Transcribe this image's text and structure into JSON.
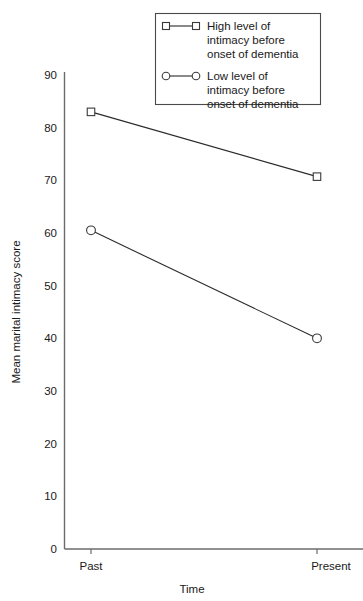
{
  "chart_data": {
    "type": "line",
    "title": "",
    "xlabel": "Time",
    "ylabel": "Mean marital intimacy score",
    "categories": [
      "Past",
      "Present"
    ],
    "x": [
      0,
      1
    ],
    "ylim": [
      0,
      90
    ],
    "yticks": [
      0,
      10,
      20,
      30,
      40,
      50,
      60,
      70,
      80,
      90
    ],
    "ytick_labels": [
      "0",
      "10",
      "20",
      "30",
      "40",
      "50",
      "60",
      "70",
      "80",
      "90"
    ],
    "grid": false,
    "legend_position": "top-right",
    "series": [
      {
        "name": "High level of intimacy before onset of dementia",
        "marker": "square",
        "values": [
          83.0,
          70.7
        ]
      },
      {
        "name": "Low level of intimacy before onset of dementia",
        "marker": "circle",
        "values": [
          60.5,
          40.0
        ]
      }
    ]
  },
  "axes": {
    "y_title": "Mean marital intimacy score",
    "x_title": "Time",
    "y_ticks": [
      {
        "label": "90"
      },
      {
        "label": "80"
      },
      {
        "label": "70"
      },
      {
        "label": "60"
      },
      {
        "label": "50"
      },
      {
        "label": "40"
      },
      {
        "label": "30"
      },
      {
        "label": "20"
      },
      {
        "label": "10"
      },
      {
        "label": "0"
      }
    ],
    "x_categories": [
      {
        "label": "Past"
      },
      {
        "label": "Present"
      }
    ]
  },
  "legend": {
    "entries": [
      {
        "marker": "square",
        "line1": "High level of",
        "line2": "intimacy before",
        "line3": "onset of dementia"
      },
      {
        "marker": "circle",
        "line1": "Low level of",
        "line2": "intimacy before",
        "line3": "onset of dementia"
      }
    ]
  },
  "colors": {
    "line": "#2b2b2b",
    "axis": "#6b6b6b",
    "marker_fill": "#ffffff",
    "text": "#1a1a1a",
    "background": "#ffffff"
  }
}
